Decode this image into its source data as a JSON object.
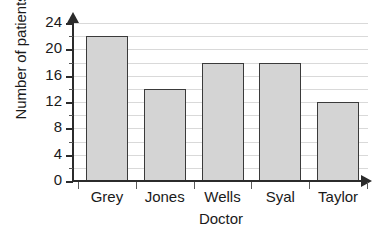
{
  "chart_data": {
    "type": "bar",
    "title": "",
    "xlabel": "Doctor",
    "ylabel": "Number of patients",
    "categories": [
      "Grey",
      "Jones",
      "Wells",
      "Syal",
      "Taylor"
    ],
    "values": [
      22,
      14,
      18,
      18,
      12
    ],
    "ylim": [
      0,
      24
    ],
    "ytick_labels": [
      "0",
      "4",
      "8",
      "12",
      "16",
      "20",
      "24"
    ],
    "ytick_values": [
      0,
      4,
      8,
      12,
      16,
      20,
      24
    ],
    "yminor_tick_values": [
      2,
      6,
      10,
      14,
      18,
      22
    ],
    "gridline_values": [
      2,
      4,
      6,
      8,
      10,
      12,
      14,
      16,
      18,
      20,
      22,
      24
    ],
    "grid": true,
    "legend": false,
    "legend_position": "none",
    "bar_fill_color": "#d4d4d4",
    "bar_border_color": "#3a3a3a",
    "gridline_color": "#d9d9d9",
    "axis_color": "#2b2b2b",
    "background_color": "#ffffff",
    "axis_arrowheads": true
  }
}
